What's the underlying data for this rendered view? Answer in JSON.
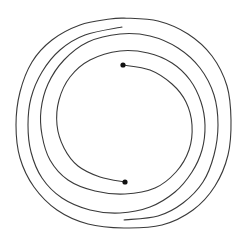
{
  "diagram": {
    "type": "maze-spiral",
    "background": "#ffffff",
    "stroke_color": "#3a3a3a",
    "dot_color": "#111111",
    "dots": [
      {
        "name": "start-dot",
        "x": 123,
        "y": 65,
        "r": 2.6
      },
      {
        "name": "end-dot",
        "x": 125,
        "y": 182,
        "r": 2.6
      }
    ],
    "strands": [
      {
        "name": "strand-from-top-dot",
        "points": [
          [
            123,
            65
          ],
          [
            150,
            70
          ],
          [
            172,
            84
          ],
          [
            186,
            102
          ],
          [
            192,
            125
          ],
          [
            189,
            150
          ],
          [
            176,
            172
          ],
          [
            155,
            188
          ],
          [
            125,
            194
          ],
          [
            95,
            191
          ],
          [
            68,
            180
          ],
          [
            50,
            160
          ],
          [
            42,
            135
          ],
          [
            41,
            110
          ],
          [
            48,
            84
          ],
          [
            64,
            60
          ],
          [
            88,
            42
          ],
          [
            120,
            34
          ],
          [
            150,
            36
          ],
          [
            178,
            48
          ],
          [
            200,
            68
          ],
          [
            214,
            95
          ],
          [
            218,
            125
          ],
          [
            214,
            155
          ],
          [
            203,
            182
          ],
          [
            183,
            203
          ],
          [
            158,
            216
          ],
          [
            124,
            220
          ]
        ]
      },
      {
        "name": "strand-from-bottom-dot",
        "points": [
          [
            125,
            182
          ],
          [
            100,
            177
          ],
          [
            78,
            166
          ],
          [
            64,
            148
          ],
          [
            57,
            125
          ],
          [
            59,
            100
          ],
          [
            70,
            77
          ],
          [
            90,
            60
          ],
          [
            120,
            51
          ],
          [
            148,
            53
          ],
          [
            172,
            63
          ],
          [
            190,
            80
          ],
          [
            201,
            102
          ],
          [
            205,
            125
          ],
          [
            202,
            150
          ],
          [
            192,
            172
          ],
          [
            175,
            192
          ],
          [
            150,
            207
          ],
          [
            120,
            213
          ],
          [
            90,
            210
          ],
          [
            62,
            198
          ],
          [
            42,
            178
          ],
          [
            31,
            152
          ],
          [
            28,
            125
          ],
          [
            31,
            98
          ],
          [
            42,
            72
          ],
          [
            60,
            50
          ],
          [
            85,
            35
          ],
          [
            122,
            27
          ]
        ]
      },
      {
        "name": "outer-ring",
        "points": [
          [
            122,
            27
          ],
          [
            122,
            27
          ]
        ]
      },
      {
        "name": "outermost-loop",
        "points": [
          [
            124,
            18
          ],
          [
            158,
            21
          ],
          [
            188,
            34
          ],
          [
            212,
            56
          ],
          [
            227,
            86
          ],
          [
            231,
            120
          ],
          [
            228,
            155
          ],
          [
            215,
            186
          ],
          [
            193,
            210
          ],
          [
            162,
            225
          ],
          [
            124,
            228
          ],
          [
            88,
            224
          ],
          [
            57,
            210
          ],
          [
            34,
            187
          ],
          [
            20,
            158
          ],
          [
            16,
            125
          ],
          [
            20,
            92
          ],
          [
            32,
            62
          ],
          [
            52,
            40
          ],
          [
            80,
            25
          ],
          [
            110,
            19
          ],
          [
            124,
            18
          ]
        ]
      }
    ]
  }
}
